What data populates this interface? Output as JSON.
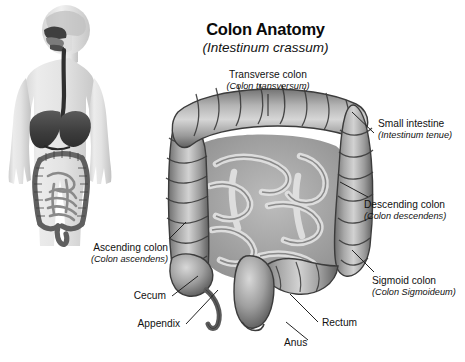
{
  "title": {
    "main": "Colon Anatomy",
    "latin": "(Intestinum crassum)"
  },
  "labels": [
    {
      "name": "transverse-colon",
      "line1": "Transverse colon",
      "line2": "(Colon transversum)"
    },
    {
      "name": "small-intestine",
      "line1": "Small intestine",
      "line2": "(Intestinum tenue)"
    },
    {
      "name": "descending-colon",
      "line1": "Descending colon",
      "line2": "(Colon descendens)"
    },
    {
      "name": "sigmoid-colon",
      "line1": "Sigmoid colon",
      "line2": "(Colon Sigmoideum)"
    },
    {
      "name": "ascending-colon",
      "line1": "Ascending colon",
      "line2": "(Colon ascendens)"
    },
    {
      "name": "cecum",
      "line1": "Cecum",
      "line2": ""
    },
    {
      "name": "appendix",
      "line1": "Appendix",
      "line2": ""
    },
    {
      "name": "rectum",
      "line1": "Rectum",
      "line2": ""
    },
    {
      "name": "anus",
      "line1": "Anus",
      "line2": ""
    }
  ],
  "figure": {
    "name": "human-body-digestive-overview",
    "organs": [
      "brain",
      "nasal-cavity",
      "oral-cavity",
      "esophagus",
      "liver",
      "stomach",
      "large-intestine",
      "small-intestine"
    ]
  },
  "colors": {
    "background": "#ffffff",
    "text": "#111111",
    "leader_line": "#222222",
    "organ_light": "#d2d2d2",
    "organ_mid": "#9a9a9a",
    "organ_dark": "#5e5e5e",
    "organ_outline": "#3a3a3a",
    "skin_light": "#e8e8e8",
    "skin_mid": "#c9c9c9",
    "viscera_dark": "#4a4a4a"
  }
}
